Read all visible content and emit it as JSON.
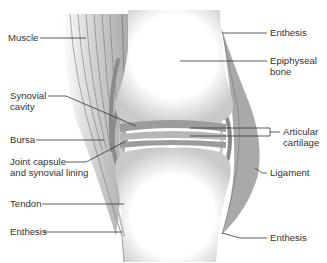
{
  "diagram": {
    "labels_left": [
      {
        "id": "muscle",
        "lines": [
          "Muscle"
        ]
      },
      {
        "id": "synovial-cavity",
        "lines": [
          "Synovial",
          "cavity"
        ]
      },
      {
        "id": "bursa",
        "lines": [
          "Bursa"
        ]
      },
      {
        "id": "joint-capsule",
        "lines": [
          "Joint capsule",
          "and synovial lining"
        ]
      },
      {
        "id": "tendon",
        "lines": [
          "Tendon"
        ]
      },
      {
        "id": "enthesis-lower-left",
        "lines": [
          "Enthesis"
        ]
      }
    ],
    "labels_right": [
      {
        "id": "enthesis-upper-right",
        "lines": [
          "Enthesis"
        ]
      },
      {
        "id": "epiphyseal-bone",
        "lines": [
          "Epiphyseal",
          "bone"
        ]
      },
      {
        "id": "articular-cartilage",
        "lines": [
          "Articular",
          "cartilage"
        ]
      },
      {
        "id": "ligament",
        "lines": [
          "Ligament"
        ]
      },
      {
        "id": "enthesis-lower-right",
        "lines": [
          "Enthesis"
        ]
      }
    ],
    "colors": {
      "background": "#ffffff",
      "bone": "#f4f4f4",
      "bone_shadow": "#bdbdbd",
      "muscle": "#b8b8b8",
      "ligament": "#a8a8a8",
      "capsule": "#8a8a8a",
      "leader_line": "#333333",
      "text": "#333333"
    }
  }
}
